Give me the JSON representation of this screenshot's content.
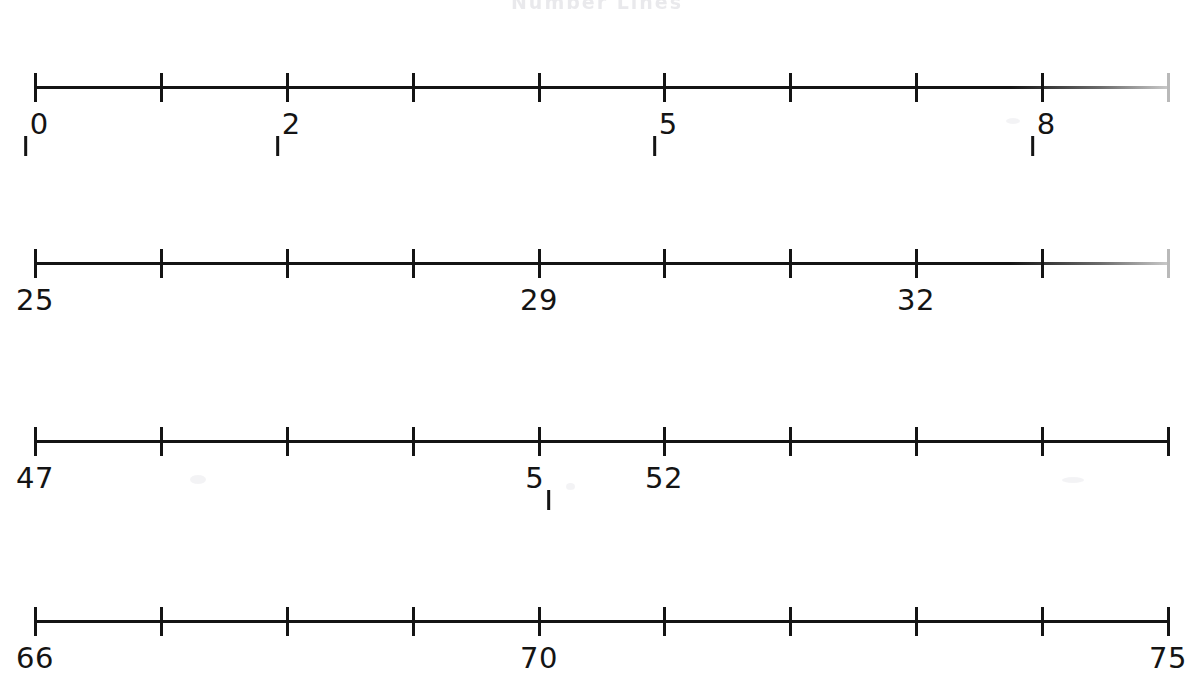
{
  "page": {
    "title_fragment": "Number Lines",
    "background_color": "#ffffff",
    "ink_color": "#141414"
  },
  "chart_data": {
    "type": "number-line",
    "title": "Number Lines",
    "xlabel": "",
    "ylabel": "",
    "tick_count_per_line": 10,
    "lines": [
      {
        "id": "line-1",
        "start_value": 10,
        "end_value": 19,
        "labels": [
          {
            "tick_index": 0,
            "value": "10"
          },
          {
            "tick_index": 2,
            "value": "12"
          },
          {
            "tick_index": 5,
            "value": "15"
          },
          {
            "tick_index": 8,
            "value": "18"
          }
        ],
        "blank_tick_indexes": [
          1,
          3,
          4,
          6,
          7,
          9
        ],
        "end_tick_faint": true
      },
      {
        "id": "line-2",
        "start_value": 25,
        "end_value": 34,
        "labels": [
          {
            "tick_index": 0,
            "value": "25"
          },
          {
            "tick_index": 4,
            "value": "29"
          },
          {
            "tick_index": 7,
            "value": "32"
          }
        ],
        "blank_tick_indexes": [
          1,
          2,
          3,
          5,
          6,
          8,
          9
        ],
        "end_tick_faint": true
      },
      {
        "id": "line-3",
        "start_value": 47,
        "end_value": 56,
        "labels": [
          {
            "tick_index": 0,
            "value": "47"
          },
          {
            "tick_index": 4,
            "value": "51"
          },
          {
            "tick_index": 5,
            "value": "52"
          }
        ],
        "blank_tick_indexes": [
          1,
          2,
          3,
          6,
          7,
          8,
          9
        ],
        "end_tick_faint": false
      },
      {
        "id": "line-4",
        "start_value": 66,
        "end_value": 75,
        "labels": [
          {
            "tick_index": 0,
            "value": "66"
          },
          {
            "tick_index": 4,
            "value": "70"
          },
          {
            "tick_index": 9,
            "value": "75"
          }
        ],
        "blank_tick_indexes": [
          1,
          2,
          3,
          5,
          6,
          7,
          8
        ],
        "end_tick_faint": false
      }
    ]
  },
  "geometry": {
    "axis_left_px": 35,
    "axis_right_px": 1168,
    "row_tops_px": [
      55,
      231,
      409,
      589
    ]
  }
}
